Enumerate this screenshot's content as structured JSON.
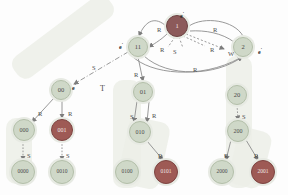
{
  "figure": {
    "type": "graph-diagram",
    "title": "",
    "background": "#fdfdfd",
    "colors": {
      "node_light": "#cfd8c8",
      "node_dark": "#9e5a55",
      "node_root": "#8c5a5a",
      "edge": "#8a8a8a",
      "band": "#eceee8",
      "text": "#3a3a3a"
    }
  },
  "nodes": [
    {
      "id": "root",
      "label": "1",
      "style": "root",
      "x": 177,
      "y": 26,
      "r": 11
    },
    {
      "id": "n11",
      "label": "11",
      "style": "light",
      "x": 138,
      "y": 47,
      "r": 10
    },
    {
      "id": "n2",
      "label": "2",
      "style": "light",
      "x": 243,
      "y": 47,
      "r": 10
    },
    {
      "id": "n00",
      "label": "00",
      "style": "light",
      "x": 61,
      "y": 90,
      "r": 10
    },
    {
      "id": "n01",
      "label": "01",
      "style": "light",
      "x": 143,
      "y": 92,
      "r": 10
    },
    {
      "id": "n20",
      "label": "20",
      "style": "light",
      "x": 237,
      "y": 95,
      "r": 10
    },
    {
      "id": "n000",
      "label": "000",
      "style": "light",
      "x": 24,
      "y": 130,
      "r": 11
    },
    {
      "id": "n001",
      "label": "001",
      "style": "dark",
      "x": 62,
      "y": 130,
      "r": 11
    },
    {
      "id": "n010",
      "label": "010",
      "style": "light",
      "x": 140,
      "y": 132,
      "r": 11
    },
    {
      "id": "n200",
      "label": "200",
      "style": "light",
      "x": 238,
      "y": 131,
      "r": 11
    },
    {
      "id": "n0000",
      "label": "0000",
      "style": "light",
      "x": 23,
      "y": 172,
      "r": 12
    },
    {
      "id": "n0010",
      "label": "0010",
      "style": "light",
      "x": 62,
      "y": 172,
      "r": 12
    },
    {
      "id": "n0100",
      "label": "0100",
      "style": "light",
      "x": 127,
      "y": 172,
      "r": 12
    },
    {
      "id": "n0101",
      "label": "0101",
      "style": "dark",
      "x": 166,
      "y": 172,
      "r": 12
    },
    {
      "id": "n2000",
      "label": "2000",
      "style": "light",
      "x": 222,
      "y": 172,
      "r": 12
    },
    {
      "id": "n2001",
      "label": "2001",
      "style": "dark",
      "x": 263,
      "y": 172,
      "r": 12
    }
  ],
  "node_annotations": [
    {
      "id": "ann-root",
      "text": "e",
      "x": 180,
      "y": 11
    },
    {
      "id": "ann-n11",
      "text": "e",
      "x": 119,
      "y": 42
    },
    {
      "id": "ann-n2",
      "text": "e",
      "x": 258,
      "y": 47
    },
    {
      "id": "ann-n00",
      "text": "e",
      "x": 72,
      "y": 83
    }
  ],
  "edge_labels": [
    {
      "id": "el-root-left",
      "text": "R",
      "x": 157,
      "y": 26
    },
    {
      "id": "el-root-right",
      "text": "R",
      "x": 213,
      "y": 26
    },
    {
      "id": "el-inner-left",
      "text": "R",
      "x": 160,
      "y": 46
    },
    {
      "id": "el-inner-s",
      "text": "S",
      "x": 173,
      "y": 48
    },
    {
      "id": "el-inner-right",
      "text": "R",
      "x": 210,
      "y": 46
    },
    {
      "id": "el-w",
      "text": "W",
      "x": 228,
      "y": 50
    },
    {
      "id": "el-bottom-arc",
      "text": "R",
      "x": 193,
      "y": 66
    },
    {
      "id": "el-s-dashdot",
      "text": "S",
      "x": 92,
      "y": 64
    },
    {
      "id": "el-t",
      "text": "T",
      "x": 100,
      "y": 84
    },
    {
      "id": "el-00-left",
      "text": "R",
      "x": 38,
      "y": 110
    },
    {
      "id": "el-00-right",
      "text": "R",
      "x": 68,
      "y": 110
    },
    {
      "id": "el-11-01",
      "text": "R",
      "x": 134,
      "y": 71
    },
    {
      "id": "el-01-left",
      "text": "S",
      "x": 130,
      "y": 113
    },
    {
      "id": "el-01-right",
      "text": "R",
      "x": 152,
      "y": 112
    },
    {
      "id": "el-010-0101",
      "text": "R",
      "x": 158,
      "y": 152
    },
    {
      "id": "el-20-200",
      "text": "S",
      "x": 242,
      "y": 113
    },
    {
      "id": "el-200-left",
      "text": "R",
      "x": 224,
      "y": 152
    },
    {
      "id": "el-200-right",
      "text": "R",
      "x": 254,
      "y": 152
    },
    {
      "id": "el-000-0000",
      "text": "S",
      "x": 27,
      "y": 152
    },
    {
      "id": "el-001-0010",
      "text": "S",
      "x": 66,
      "y": 152
    }
  ],
  "bands": [
    {
      "id": "band-left",
      "x": 10,
      "y": 60,
      "w": 120,
      "h": 130,
      "rotate": -38
    },
    {
      "id": "band-middle",
      "x": 112,
      "y": 78,
      "w": 28,
      "h": 112,
      "rotate": 0
    },
    {
      "id": "band-right",
      "x": 208,
      "y": 55,
      "w": 30,
      "h": 135,
      "rotate": 0
    }
  ],
  "edges": [
    {
      "from": "root",
      "to": "n11",
      "kind": "curve",
      "label": "R"
    },
    {
      "from": "root",
      "to": "n2",
      "kind": "curve",
      "label": "R"
    },
    {
      "from": "n11",
      "to": "root",
      "kind": "curve2",
      "label": "R"
    },
    {
      "from": "n2",
      "to": "n11",
      "kind": "arc",
      "label": "R"
    },
    {
      "from": "root",
      "to": "n2",
      "kind": "dashed",
      "label": "R"
    },
    {
      "from": "root",
      "to": "n11",
      "kind": "dashed",
      "label": "S"
    },
    {
      "from": "n11",
      "to": "n00",
      "kind": "dashdot",
      "label": "S"
    },
    {
      "from": "n11",
      "to": "n01",
      "kind": "solid",
      "label": "R"
    },
    {
      "from": "n00",
      "to": "n000",
      "kind": "solid",
      "label": "R"
    },
    {
      "from": "n00",
      "to": "n001",
      "kind": "solid",
      "label": "R"
    },
    {
      "from": "n000",
      "to": "n0000",
      "kind": "solid",
      "label": "S"
    },
    {
      "from": "n001",
      "to": "n0010",
      "kind": "solid",
      "label": "S"
    },
    {
      "from": "n01",
      "to": "n010",
      "kind": "solid",
      "label": "S"
    },
    {
      "from": "n01",
      "to": "n010",
      "kind": "solid",
      "label": "R"
    },
    {
      "from": "n010",
      "to": "n0101",
      "kind": "solid",
      "label": "R"
    },
    {
      "from": "n20",
      "to": "n200",
      "kind": "solid",
      "label": "S"
    },
    {
      "from": "n200",
      "to": "n2000",
      "kind": "solid",
      "label": "R"
    },
    {
      "from": "n200",
      "to": "n2001",
      "kind": "solid",
      "label": "R"
    }
  ]
}
